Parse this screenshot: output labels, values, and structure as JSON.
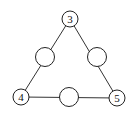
{
  "diagram": {
    "type": "triangle-number-puzzle",
    "nodes": [
      {
        "id": "top",
        "label": "3",
        "cx": 70,
        "cy": 19,
        "r": 8
      },
      {
        "id": "left-mid",
        "label": "",
        "cx": 45,
        "cy": 57,
        "r": 9.5
      },
      {
        "id": "right-mid",
        "label": "",
        "cx": 97,
        "cy": 57,
        "r": 9.5
      },
      {
        "id": "bottom-left",
        "label": "4",
        "cx": 21,
        "cy": 97,
        "r": 8
      },
      {
        "id": "bottom-mid",
        "label": "",
        "cx": 69,
        "cy": 97,
        "r": 9.5
      },
      {
        "id": "bottom-right",
        "label": "5",
        "cx": 117,
        "cy": 98,
        "r": 8
      }
    ],
    "edges": [
      [
        "top",
        "bottom-left"
      ],
      [
        "top",
        "bottom-right"
      ],
      [
        "bottom-left",
        "bottom-right"
      ]
    ],
    "colors": {
      "stroke": "#222222",
      "fill": "#ffffff"
    }
  }
}
